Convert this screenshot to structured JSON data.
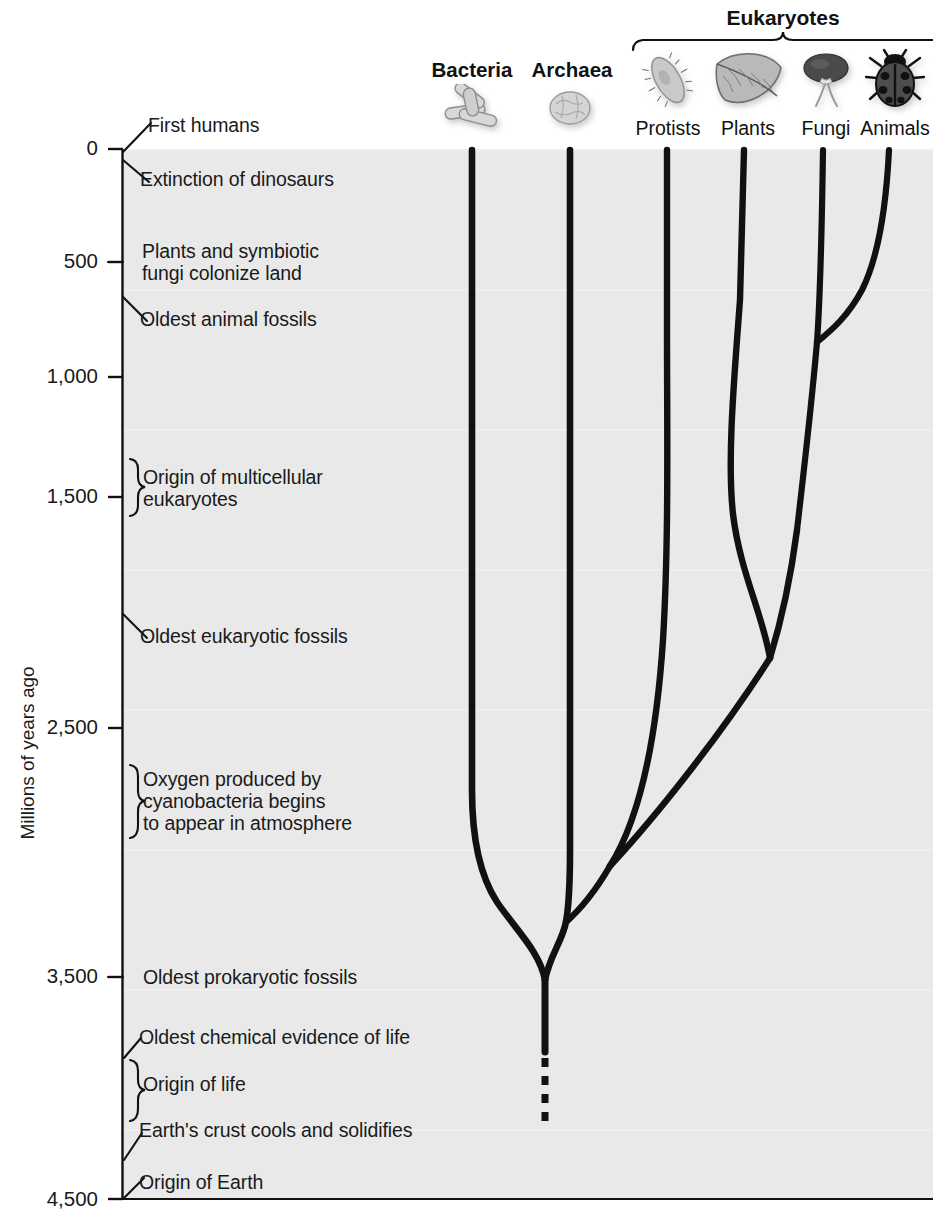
{
  "figure": {
    "y_axis_title": "Millions of years ago",
    "group_label": "Eukaryotes"
  },
  "taxa": [
    {
      "name": "Bacteria",
      "icon": "bacteria-rods-icon",
      "bold": true,
      "x": 472,
      "label_y": 62,
      "icon_y": 84
    },
    {
      "name": "Archaea",
      "icon": "archaea-cell-icon",
      "bold": true,
      "x": 570,
      "label_y": 62,
      "icon_y": 84
    },
    {
      "name": "Protists",
      "icon": "paramecium-icon",
      "bold": false,
      "x": 668,
      "label_y": 120,
      "icon_y": 52
    },
    {
      "name": "Plants",
      "icon": "leaf-icon",
      "bold": false,
      "x": 748,
      "label_y": 120,
      "icon_y": 52
    },
    {
      "name": "Fungi",
      "icon": "mushroom-icon",
      "bold": false,
      "x": 826,
      "label_y": 120,
      "icon_y": 52
    },
    {
      "name": "Animals",
      "icon": "ladybug-icon",
      "bold": false,
      "x": 895,
      "label_y": 120,
      "icon_y": 52
    }
  ],
  "axis": {
    "ticks": [
      {
        "value": "0",
        "y": 149
      },
      {
        "value": "500",
        "y": 262
      },
      {
        "value": "1,000",
        "y": 377
      },
      {
        "value": "1,500",
        "y": 497
      },
      {
        "value": "2,500",
        "y": 728
      },
      {
        "value": "3,500",
        "y": 977
      },
      {
        "value": "4,500",
        "y": 1200
      }
    ],
    "min": 0,
    "max": 4500,
    "unit": "millions of years ago"
  },
  "events": [
    {
      "label": "First humans",
      "marker": "leader-up",
      "tick_y": 149,
      "text_x": 146,
      "text_y": 117
    },
    {
      "label": "Extinction of dinosaurs",
      "marker": "leader-down",
      "tick_y": 162,
      "text_x": 140,
      "text_y": 167
    },
    {
      "label": "Plants and symbiotic\nfungi colonize land",
      "marker": "tick",
      "tick_y": 262,
      "text_x": 143,
      "text_y": 241
    },
    {
      "label": "Oldest animal fossils",
      "marker": "leader-down",
      "tick_y": 300,
      "text_x": 140,
      "text_y": 307
    },
    {
      "label": "Origin of multicellular\neukaryotes",
      "marker": "brace",
      "tick_y": 487,
      "text_x": 143,
      "text_y": 466
    },
    {
      "label": "Oldest eukaryotic fossils",
      "marker": "leader-down",
      "tick_y": 617,
      "text_x": 140,
      "text_y": 624
    },
    {
      "label": "Oxygen produced by\ncyanobacteria begins\nto appear in atmosphere",
      "marker": "brace",
      "tick_y": 800,
      "text_x": 143,
      "text_y": 769
    },
    {
      "label": "Oldest prokaryotic fossils",
      "marker": "tick",
      "tick_y": 977,
      "text_x": 143,
      "text_y": 966
    },
    {
      "label": "Oldest chemical evidence of life",
      "marker": "leader-up",
      "tick_y": 1045,
      "text_x": 138,
      "text_y": 1026
    },
    {
      "label": "Origin of life",
      "marker": "brace",
      "tick_y": 1086,
      "text_x": 143,
      "text_y": 1074
    },
    {
      "label": "Earth's crust cools and solidifies",
      "marker": "leader-up",
      "tick_y": 1152,
      "text_x": 138,
      "text_y": 1120
    },
    {
      "label": "Origin of Earth",
      "marker": "leader-up",
      "tick_y": 1198,
      "text_x": 138,
      "text_y": 1172
    }
  ],
  "tree": {
    "root_x": 545,
    "root_y": 980,
    "stem_dash_top": 1052,
    "stem_dash_bottom": 1120,
    "nodes": [
      {
        "name": "root-prokaryote-split",
        "x": 545,
        "y": 980
      },
      {
        "name": "archaea-eukaryote-split",
        "x": 565,
        "y": 920
      },
      {
        "name": "protist-lineage-split",
        "x": 605,
        "y": 865
      },
      {
        "name": "plants-fungi-animals-split",
        "x": 770,
        "y": 658
      },
      {
        "name": "fungi-plants-split",
        "x": 798,
        "y": 528
      },
      {
        "name": "fungi-animals-split",
        "x": 818,
        "y": 340
      }
    ]
  },
  "colors": {
    "field": "#e9e9e9",
    "line": "#111111",
    "text": "#1a1a1a",
    "page": "#ffffff"
  }
}
